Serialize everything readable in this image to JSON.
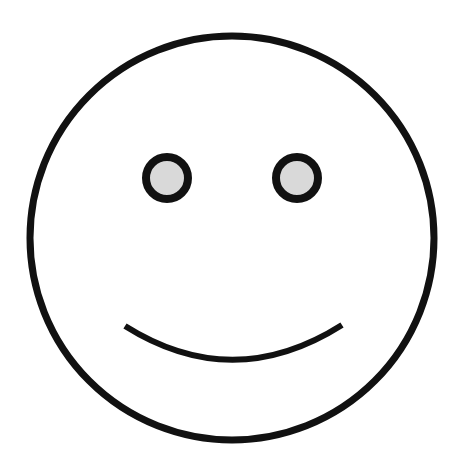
{
  "figure": {
    "subject": "smiley face",
    "colors": {
      "background": "#ffffff",
      "stroke": "#111111",
      "eye_fill": "#d9d9d9"
    },
    "face": {
      "cx": 232,
      "cy": 238,
      "r": 202,
      "stroke_width": 7
    },
    "eyes": [
      {
        "name": "left",
        "cx": 167,
        "cy": 178,
        "r": 21,
        "stroke_width": 8
      },
      {
        "name": "right",
        "cx": 297,
        "cy": 178,
        "r": 21,
        "stroke_width": 8
      }
    ],
    "mouth": {
      "path": "M 125 326 Q 233 394 342 325",
      "stroke_width": 6
    }
  }
}
